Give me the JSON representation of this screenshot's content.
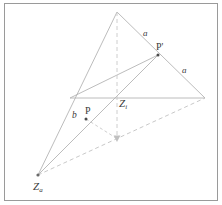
{
  "figure": {
    "kind": "geometry-diagram",
    "canvas": {
      "width": 222,
      "height": 205
    },
    "frame": {
      "x": 4,
      "y": 3,
      "width": 214,
      "height": 198,
      "stroke": "#9a9a9a"
    },
    "colors": {
      "solid_line": "#b4b4b4",
      "dashed_line": "#c2c2c2",
      "vertical_dashed": "#c8c8c8",
      "point_fill": "#4a4a4a",
      "label_text": "#3a3a3a",
      "background": "#ffffff"
    },
    "points": {
      "apex": {
        "x": 117,
        "y": 12,
        "label": ""
      },
      "right_vertex": {
        "x": 205,
        "y": 98,
        "label": ""
      },
      "left_mid": {
        "x": 70,
        "y": 98,
        "label": ""
      },
      "z_i": {
        "x": 117,
        "y": 98,
        "label": "Z",
        "sub": "i"
      },
      "z_a": {
        "x": 38,
        "y": 175,
        "label": "Z",
        "sub": "a"
      },
      "p_prime": {
        "x": 158,
        "y": 55,
        "label": "P'"
      },
      "p": {
        "x": 86,
        "y": 119,
        "label": "P"
      },
      "arrow_tip": {
        "x": 117,
        "y": 141,
        "label": ""
      },
      "p_dash_end": {
        "x": 117,
        "y": 141,
        "label": ""
      }
    },
    "labels": [
      {
        "name": "side-a-upper",
        "text": "a",
        "x": 143,
        "y": 29,
        "style": "a"
      },
      {
        "name": "side-a-lower",
        "text": "a",
        "x": 182,
        "y": 66,
        "style": "a"
      },
      {
        "name": "side-b",
        "text": "b",
        "x": 72,
        "y": 111,
        "style": "b"
      },
      {
        "name": "point-p-prime",
        "text": "P'",
        "x": 156,
        "y": 42,
        "style": "pt"
      },
      {
        "name": "point-p",
        "text": "P",
        "x": 85,
        "y": 106,
        "style": "pt"
      }
    ],
    "z_labels": [
      {
        "name": "point-z-i",
        "main": "Z",
        "sub": "i",
        "x": 119,
        "y": 98
      },
      {
        "name": "point-z-a",
        "main": "Z",
        "sub": "a",
        "x": 33,
        "y": 181
      }
    ],
    "segments": [
      {
        "name": "apex-to-right-vertex",
        "x1": 117,
        "y1": 12,
        "x2": 205,
        "y2": 98,
        "dashed": false
      },
      {
        "name": "apex-to-z-a",
        "x1": 117,
        "y1": 12,
        "x2": 38,
        "y2": 175,
        "dashed": false
      },
      {
        "name": "left-mid-to-right-vertex",
        "x1": 70,
        "y1": 98,
        "x2": 205,
        "y2": 98,
        "dashed": false
      },
      {
        "name": "left-mid-to-p-prime",
        "x1": 70,
        "y1": 98,
        "x2": 158,
        "y2": 55,
        "dashed": false
      },
      {
        "name": "z-a-to-p-prime",
        "x1": 38,
        "y1": 175,
        "x2": 158,
        "y2": 55,
        "dashed": false
      },
      {
        "name": "z-a-to-right-vertex-dashed",
        "x1": 38,
        "y1": 175,
        "x2": 205,
        "y2": 98,
        "dashed": true
      },
      {
        "name": "apex-vertical-dashed",
        "x1": 117,
        "y1": 12,
        "x2": 117,
        "y2": 139,
        "dashed": true
      },
      {
        "name": "p-to-arrow-tip-dashed",
        "x1": 86,
        "y1": 119,
        "x2": 117,
        "y2": 139,
        "dashed": true
      }
    ],
    "arrows": [
      {
        "name": "vertical-projection-arrow",
        "x": 117,
        "y": 141,
        "direction": "down"
      }
    ],
    "dots": [
      {
        "name": "dot-p",
        "x": 86,
        "y": 119,
        "r": 1.5
      },
      {
        "name": "dot-p-prime",
        "x": 158,
        "y": 55,
        "r": 1.5
      },
      {
        "name": "dot-z-a",
        "x": 38,
        "y": 175,
        "r": 1.5
      }
    ]
  }
}
